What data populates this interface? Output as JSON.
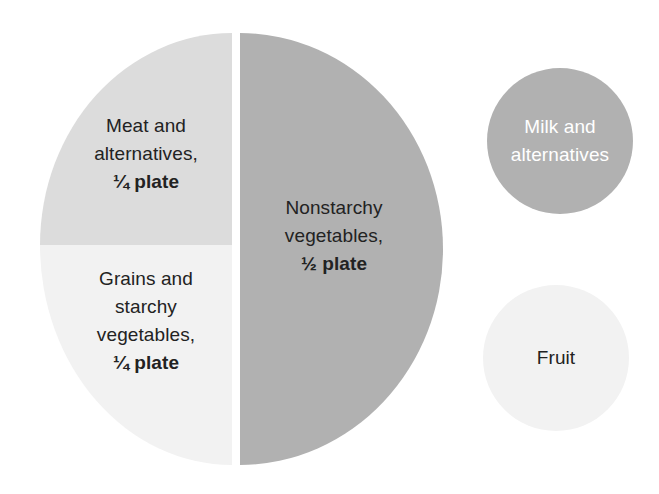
{
  "diagram": {
    "plate": {
      "sections": [
        {
          "id": "meat",
          "name": "Meat and alternatives",
          "line1": "Meat and",
          "line2": "alternatives,",
          "portion": "¼ plate",
          "fraction": "1/4",
          "color": "#dcdcdc",
          "text_color": "#222222"
        },
        {
          "id": "grains",
          "name": "Grains and starchy vegetables",
          "line1": "Grains and",
          "line2": "starchy",
          "line3": "vegetables,",
          "portion": "¼ plate",
          "fraction": "1/4",
          "color": "#f2f2f2",
          "text_color": "#222222"
        },
        {
          "id": "nonstarchy",
          "name": "Nonstarchy vegetables",
          "line1": "Nonstarchy",
          "line2": "vegetables,",
          "portion": "½ plate",
          "fraction": "1/2",
          "color": "#b1b1b1",
          "text_color": "#222222"
        }
      ]
    },
    "side_items": [
      {
        "id": "milk",
        "label": "Milk and alternatives",
        "color": "#b1b1b1",
        "text_color": "#ffffff"
      },
      {
        "id": "fruit",
        "label": "Fruit",
        "color": "#f2f2f2",
        "text_color": "#222222"
      }
    ]
  }
}
